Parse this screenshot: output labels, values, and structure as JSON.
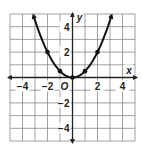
{
  "chart_data": {
    "type": "line",
    "title": "",
    "function": "y = 0.5x^2",
    "xlabel": "x",
    "ylabel": "y",
    "origin_label": "O",
    "xlim": [
      -5,
      5
    ],
    "ylim": [
      -5,
      5
    ],
    "grid": true,
    "x_ticks": [
      {
        "value": -4,
        "label": "−4"
      },
      {
        "value": -2,
        "label": "−2"
      },
      {
        "value": 2,
        "label": "2"
      },
      {
        "value": 4,
        "label": "4"
      }
    ],
    "y_ticks": [
      {
        "value": 4,
        "label": "4"
      },
      {
        "value": 2,
        "label": "2"
      },
      {
        "value": -2,
        "label": "−2"
      },
      {
        "value": -4,
        "label": "−4"
      }
    ],
    "points": [
      {
        "x": -2,
        "y": 2
      },
      {
        "x": -1,
        "y": 0.5
      },
      {
        "x": 0,
        "y": 0
      },
      {
        "x": 1,
        "y": 0.5
      },
      {
        "x": 2,
        "y": 2
      }
    ],
    "curve_x_range": [
      -3.1,
      3.1
    ],
    "curve_arrows": true,
    "colors": {
      "grid": "#888888",
      "axis": "#222222",
      "curve": "#111111"
    }
  }
}
